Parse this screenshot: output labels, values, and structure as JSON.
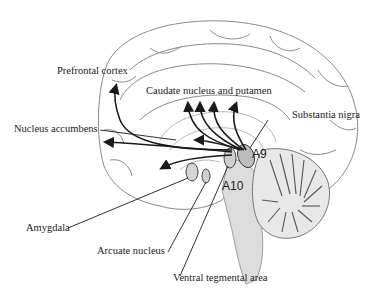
{
  "diagram": {
    "labels": {
      "prefrontal_cortex": "Prefrontal cortex",
      "caudate_putamen": "Caudate nucleus and putamen",
      "substantia_nigra": "Substantia nigra",
      "nucleus_accumbens": "Nucleus accumbens",
      "a9": "A9",
      "a10": "A10",
      "amygdala": "Amygdala",
      "arcuate_nucleus": "Arcuate nucleus",
      "ventral_tegmental_area": "Ventral tegmental area"
    },
    "colors": {
      "ink": "#1a1a1a",
      "outline": "#8a8a8a",
      "shade": "#c8c8c8"
    }
  }
}
